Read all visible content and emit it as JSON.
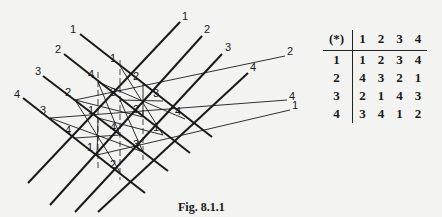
{
  "figure": {
    "caption": "Fig. 8.1.1",
    "down_lines": [
      {
        "label": "1",
        "label_pos": [
          73,
          30
        ],
        "start": [
          80,
          34
        ],
        "end": [
          212,
          137
        ]
      },
      {
        "label": "2",
        "label_pos": [
          58,
          50
        ],
        "start": [
          64,
          54
        ],
        "end": [
          190,
          153
        ]
      },
      {
        "label": "3",
        "label_pos": [
          38,
          72
        ],
        "start": [
          43,
          76
        ],
        "end": [
          168,
          171
        ]
      },
      {
        "label": "4",
        "label_pos": [
          17,
          95
        ],
        "start": [
          23,
          98
        ],
        "end": [
          145,
          193
        ]
      }
    ],
    "up_lines": [
      {
        "label": "1",
        "label_pos": [
          185,
          17
        ],
        "start": [
          28,
          183
        ],
        "end": [
          180,
          22
        ]
      },
      {
        "label": "2",
        "label_pos": [
          207,
          30
        ],
        "start": [
          50,
          205
        ],
        "end": [
          202,
          36
        ]
      },
      {
        "label": "3",
        "label_pos": [
          228,
          48
        ],
        "start": [
          75,
          212
        ],
        "end": [
          222,
          54
        ]
      },
      {
        "label": "4",
        "label_pos": [
          253,
          68
        ],
        "start": [
          98,
          212
        ],
        "end": [
          248,
          73
        ]
      }
    ],
    "transversals": [
      {
        "label": "2",
        "label_pos": [
          290,
          52
        ],
        "start": [
          75,
          100
        ],
        "end": [
          285,
          56
        ]
      },
      {
        "label": "4",
        "label_pos": [
          292,
          97
        ],
        "start": [
          50,
          118
        ],
        "end": [
          287,
          100
        ]
      },
      {
        "label": "1",
        "label_pos": [
          295,
          106
        ],
        "start": [
          97,
          155
        ],
        "end": [
          290,
          110
        ]
      }
    ],
    "intersections": [
      {
        "row": 1,
        "col": 1,
        "value": "1",
        "pos": [
          120,
          66
        ]
      },
      {
        "row": 1,
        "col": 2,
        "value": "2",
        "pos": [
          143,
          84
        ]
      },
      {
        "row": 1,
        "col": 3,
        "value": "3",
        "pos": [
          163,
          101
        ]
      },
      {
        "row": 1,
        "col": 4,
        "value": "4",
        "pos": [
          185,
          119
        ]
      },
      {
        "row": 2,
        "col": 1,
        "value": "4",
        "pos": [
          98,
          82
        ]
      },
      {
        "row": 2,
        "col": 2,
        "value": "3",
        "pos": [
          120,
          100
        ]
      },
      {
        "row": 2,
        "col": 3,
        "value": "2",
        "pos": [
          143,
          117
        ]
      },
      {
        "row": 2,
        "col": 4,
        "value": "1",
        "pos": [
          163,
          135
        ]
      },
      {
        "row": 3,
        "col": 1,
        "value": "2",
        "pos": [
          75,
          100
        ]
      },
      {
        "row": 3,
        "col": 2,
        "value": "1",
        "pos": [
          98,
          118
        ]
      },
      {
        "row": 3,
        "col": 3,
        "value": "4",
        "pos": [
          120,
          135
        ]
      },
      {
        "row": 3,
        "col": 4,
        "value": "3",
        "pos": [
          143,
          152
        ]
      },
      {
        "row": 4,
        "col": 1,
        "value": "3",
        "pos": [
          50,
          118
        ]
      },
      {
        "row": 4,
        "col": 2,
        "value": "4",
        "pos": [
          75,
          138
        ]
      },
      {
        "row": 4,
        "col": 3,
        "value": "1",
        "pos": [
          97,
          155
        ]
      },
      {
        "row": 4,
        "col": 4,
        "value": "2",
        "pos": [
          120,
          172
        ]
      }
    ]
  },
  "table": {
    "corner": "(*)",
    "columns": [
      "1",
      "2",
      "3",
      "4"
    ],
    "rows": [
      {
        "head": "1",
        "cells": [
          "1",
          "2",
          "3",
          "4"
        ]
      },
      {
        "head": "2",
        "cells": [
          "4",
          "3",
          "2",
          "1"
        ]
      },
      {
        "head": "3",
        "cells": [
          "2",
          "1",
          "4",
          "3"
        ]
      },
      {
        "head": "4",
        "cells": [
          "3",
          "4",
          "1",
          "2"
        ]
      }
    ]
  },
  "colors": {
    "ink": "#1a1a1a",
    "paper": "#f3f3f1",
    "bleed": "#d9d9d6"
  }
}
